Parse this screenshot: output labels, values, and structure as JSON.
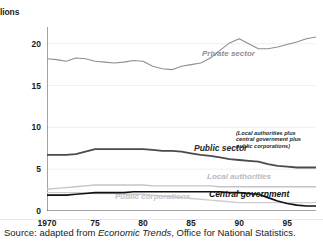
{
  "figure": {
    "top_cut_text": "",
    "axis_unit_label": "lions",
    "source_prefix": "Source: adapted from ",
    "source_italic": "Economic Trends",
    "source_suffix": ", Office for National Statistics."
  },
  "chart_data": {
    "type": "line",
    "title": "",
    "subtitle": "",
    "xlabel": "",
    "ylabel": "millions",
    "ylim": [
      0,
      22
    ],
    "xlim": [
      1970,
      1998
    ],
    "yticks": [
      0,
      5,
      10,
      15,
      20
    ],
    "ytick_labels": [
      "0",
      "5",
      "10",
      "15",
      "20"
    ],
    "xticks": [
      1970,
      1975,
      1980,
      1985,
      1990,
      1995
    ],
    "xtick_labels": [
      "1970",
      "75",
      "80",
      "85",
      "90",
      "95"
    ],
    "minor_xticks_every": 1,
    "grid": "horizontal-light",
    "legend_position": "inline-annotations",
    "x": [
      1970,
      1971,
      1972,
      1973,
      1974,
      1975,
      1976,
      1977,
      1978,
      1979,
      1980,
      1981,
      1982,
      1983,
      1984,
      1985,
      1986,
      1987,
      1988,
      1989,
      1990,
      1991,
      1992,
      1993,
      1994,
      1995,
      1996,
      1997,
      1998
    ],
    "series": [
      {
        "name": "Private sector",
        "color": "#8e8e94",
        "width": 1.1,
        "values": [
          18.2,
          18.1,
          17.9,
          18.3,
          18.2,
          17.9,
          17.8,
          17.7,
          17.8,
          18.0,
          17.9,
          17.3,
          17.0,
          16.9,
          17.3,
          17.5,
          17.7,
          18.3,
          19.2,
          20.1,
          20.6,
          20.0,
          19.4,
          19.4,
          19.6,
          19.9,
          20.2,
          20.6,
          20.8
        ]
      },
      {
        "name": "Public sector",
        "annotation": "(Local authorities plus central government plus public corporations)",
        "color": "#4a4a4f",
        "width": 1.8,
        "values": [
          6.7,
          6.7,
          6.7,
          6.8,
          7.1,
          7.4,
          7.4,
          7.4,
          7.4,
          7.4,
          7.4,
          7.3,
          7.2,
          7.2,
          7.1,
          6.9,
          6.7,
          6.6,
          6.4,
          6.2,
          6.1,
          6.0,
          5.9,
          5.6,
          5.4,
          5.3,
          5.2,
          5.2,
          5.2
        ]
      },
      {
        "name": "Local authorities",
        "color": "#c4c4ca",
        "width": 1.4,
        "values": [
          2.6,
          2.7,
          2.8,
          2.9,
          3.0,
          3.1,
          3.1,
          3.1,
          3.1,
          3.1,
          3.1,
          3.0,
          3.0,
          3.0,
          3.0,
          3.0,
          3.0,
          3.0,
          2.9,
          2.9,
          2.9,
          2.9,
          2.9,
          2.9,
          2.9,
          2.9,
          2.9,
          2.9,
          2.9
        ]
      },
      {
        "name": "Public corporations",
        "color": "#cdcdd3",
        "width": 1.4,
        "values": [
          2.2,
          2.2,
          2.2,
          2.2,
          2.2,
          2.1,
          2.1,
          2.1,
          2.0,
          2.0,
          2.0,
          1.9,
          1.8,
          1.7,
          1.6,
          1.5,
          1.4,
          1.3,
          1.2,
          1.1,
          1.0,
          1.0,
          1.0,
          1.0,
          1.0,
          1.0,
          1.0,
          1.0,
          1.0
        ]
      },
      {
        "name": "Central government",
        "color": "#111111",
        "width": 1.6,
        "values": [
          1.9,
          1.9,
          1.9,
          2.0,
          2.1,
          2.2,
          2.2,
          2.2,
          2.2,
          2.3,
          2.3,
          2.3,
          2.3,
          2.3,
          2.3,
          2.3,
          2.3,
          2.3,
          2.3,
          2.2,
          2.2,
          2.1,
          2.0,
          1.6,
          1.2,
          0.9,
          0.7,
          0.6,
          0.6
        ]
      }
    ]
  }
}
